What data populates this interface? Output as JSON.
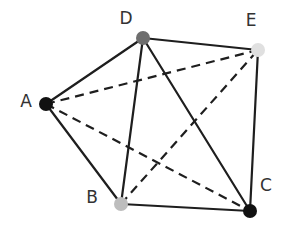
{
  "diagram": {
    "type": "graph",
    "nodes": [
      {
        "id": "A",
        "label": "A",
        "x": 46,
        "y": 104,
        "color": "#111111",
        "label_x": 26,
        "label_y": 107
      },
      {
        "id": "D",
        "label": "D",
        "x": 143,
        "y": 38,
        "color": "#6e6e6e",
        "label_x": 126,
        "label_y": 24
      },
      {
        "id": "E",
        "label": "E",
        "x": 258,
        "y": 50,
        "color": "#e0e0e0",
        "label_x": 251,
        "label_y": 26
      },
      {
        "id": "B",
        "label": "B",
        "x": 121,
        "y": 204,
        "color": "#bdbdbd",
        "label_x": 92,
        "label_y": 203
      },
      {
        "id": "C",
        "label": "C",
        "x": 250,
        "y": 211,
        "color": "#111111",
        "label_x": 266,
        "label_y": 191
      }
    ],
    "edges": [
      {
        "from": "A",
        "to": "D",
        "style": "solid"
      },
      {
        "from": "D",
        "to": "E",
        "style": "solid"
      },
      {
        "from": "E",
        "to": "C",
        "style": "solid"
      },
      {
        "from": "C",
        "to": "B",
        "style": "solid"
      },
      {
        "from": "B",
        "to": "A",
        "style": "solid"
      },
      {
        "from": "D",
        "to": "B",
        "style": "solid"
      },
      {
        "from": "D",
        "to": "C",
        "style": "solid"
      },
      {
        "from": "A",
        "to": "E",
        "style": "dashed"
      },
      {
        "from": "A",
        "to": "C",
        "style": "dashed"
      },
      {
        "from": "B",
        "to": "E",
        "style": "dashed"
      }
    ],
    "node_radius": 7,
    "edge_color": "#1e1e1e"
  }
}
